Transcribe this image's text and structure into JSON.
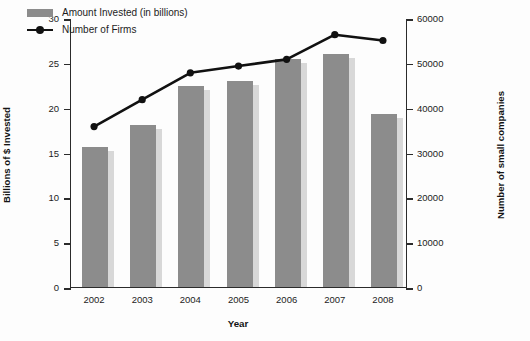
{
  "chart_data": {
    "type": "bar",
    "title": "",
    "subtitle": "",
    "xlabel": "Year",
    "ylabel": "Billions of $ Invested",
    "ylabel_secondary": "Number of small companies",
    "categories": [
      "2002",
      "2003",
      "2004",
      "2005",
      "2006",
      "2007",
      "2008"
    ],
    "ylim": [
      0,
      30
    ],
    "ylim_secondary": [
      0,
      60000
    ],
    "yticks": [
      0,
      5,
      10,
      15,
      20,
      25,
      30
    ],
    "yticks_secondary": [
      0,
      10000,
      20000,
      30000,
      40000,
      50000,
      60000
    ],
    "grid": false,
    "legend_position": "top-left",
    "series": [
      {
        "name": "Amount Invested (in billions)",
        "type": "bar",
        "axis": "left",
        "color": "#8c8c8c",
        "values": [
          15.6,
          18.1,
          22.4,
          23.0,
          25.4,
          26.0,
          19.3
        ]
      },
      {
        "name": "Number of Firms",
        "type": "line",
        "axis": "right",
        "color": "#111111",
        "values": [
          36000,
          42000,
          48000,
          49500,
          51000,
          56500,
          55200
        ]
      }
    ]
  },
  "legend": {
    "items": [
      {
        "label": "Amount Invested (in billions)",
        "marker": "bar-swatch-icon"
      },
      {
        "label": "Number of Firms",
        "marker": "line-marker-icon"
      }
    ]
  },
  "axes": {
    "left_title": "Billions of $ Invested",
    "right_title": "Number of small companies",
    "x_title": "Year"
  }
}
